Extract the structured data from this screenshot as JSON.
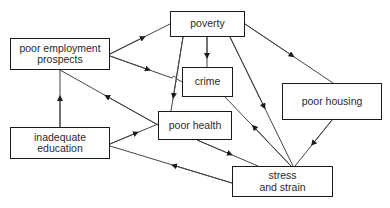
{
  "diagram": {
    "type": "causal-flow-diagram",
    "nodes": {
      "poor_employment": {
        "line1": "poor employment",
        "line2": "prospects"
      },
      "poverty": {
        "label": "poverty"
      },
      "crime": {
        "label": "crime"
      },
      "poor_housing": {
        "label": "poor housing"
      },
      "poor_health": {
        "label": "poor health"
      },
      "inadequate_education": {
        "line1": "inadequate",
        "line2": "education"
      },
      "stress_strain": {
        "line1": "stress",
        "line2": "and strain"
      }
    },
    "edges": [
      {
        "from": "poor employment prospects",
        "to": "poverty"
      },
      {
        "from": "poor employment prospects",
        "to": "crime"
      },
      {
        "from": "poverty",
        "to": "crime"
      },
      {
        "from": "poverty",
        "to": "poor health"
      },
      {
        "from": "poverty",
        "to": "poor housing"
      },
      {
        "from": "poverty",
        "to": "stress and strain"
      },
      {
        "from": "stress and strain",
        "to": "crime"
      },
      {
        "from": "poor housing",
        "to": "stress and strain"
      },
      {
        "from": "poor health",
        "to": "stress and strain"
      },
      {
        "from": "poor health",
        "to": "poor employment prospects"
      },
      {
        "from": "inadequate education",
        "to": "poor employment prospects"
      },
      {
        "from": "inadequate education",
        "to": "poor health"
      },
      {
        "from": "stress and strain",
        "to": "inadequate education"
      }
    ],
    "colors": {
      "line": "#333333",
      "border": "#1a1a1a",
      "text": "#2a2a2a"
    }
  }
}
